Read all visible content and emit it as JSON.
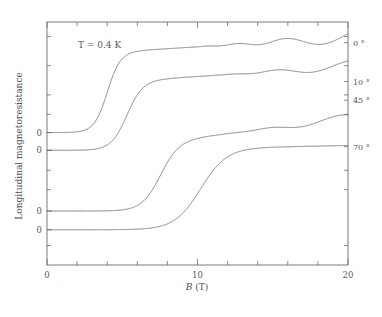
{
  "figure": {
    "annotation": "T = 0.4 K",
    "background_color": "#ffffff",
    "line_color": "#5a5a5a",
    "axis_color": "#6e6e6e"
  },
  "chart_data": {
    "type": "line",
    "title": "",
    "subtitle": "",
    "xlabel": "B (T)",
    "xlabel_italic_part": "B",
    "xlabel_upright_part": " (T)",
    "ylabel": "Longitudinal magnetoresistance",
    "xlim": [
      0,
      20
    ],
    "ylim": [
      0,
      1
    ],
    "x_major_ticks": [
      0,
      10,
      20
    ],
    "x_major_tick_labels": [
      "0",
      "10",
      "20"
    ],
    "x_minor_tick_interval": 2,
    "y_tick_labels": [
      "0",
      "0",
      "0",
      "0"
    ],
    "y_axis_note": "four zero baselines, one per offset trace",
    "grid": false,
    "legend_position": "right-of-axes",
    "annotations": [
      {
        "text": "T = 0.4 K",
        "x": 2.4,
        "y": 0.905
      }
    ],
    "series": [
      {
        "name": "0 deg",
        "label": "0 °",
        "angle_deg": 0,
        "baseline_y": 0.545,
        "step_center_B": 4.0,
        "step_width_B": 0.95,
        "step_height": 0.33,
        "post_slope_per_T": 0.0038,
        "osc_onset_B": 9.2,
        "osc_amp_max": 0.03,
        "osc_freq_inv_T": 62.0,
        "osc_phase": 0.4,
        "end_label_y": 0.915
      },
      {
        "name": "10 deg",
        "label": "10 °",
        "angle_deg": 10,
        "baseline_y": 0.472,
        "step_center_B": 5.3,
        "step_width_B": 1.15,
        "step_height": 0.285,
        "post_slope_per_T": 0.004,
        "osc_onset_B": 10.8,
        "osc_amp_max": 0.024,
        "osc_freq_inv_T": 60.0,
        "osc_phase": 0.2,
        "end_label_y": 0.755
      },
      {
        "name": "45 deg",
        "label": "45 °",
        "angle_deg": 45,
        "baseline_y": 0.222,
        "step_center_B": 7.5,
        "step_width_B": 1.35,
        "step_height": 0.285,
        "post_slope_per_T": 0.0075,
        "osc_onset_B": 11.6,
        "osc_amp_max": 0.022,
        "osc_freq_inv_T": 58.0,
        "osc_phase": 0.0,
        "end_label_y": 0.678
      },
      {
        "name": "70 deg",
        "label": "70 °",
        "angle_deg": 70,
        "baseline_y": 0.145,
        "step_center_B": 10.2,
        "step_width_B": 1.9,
        "step_height": 0.335,
        "post_slope_per_T": 0.0012,
        "osc_onset_B": 99.0,
        "osc_amp_max": 0.0,
        "osc_freq_inv_T": 0.0,
        "osc_phase": 0.0,
        "end_label_y": 0.487
      }
    ]
  }
}
